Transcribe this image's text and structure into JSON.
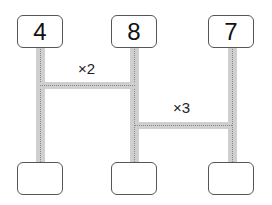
{
  "diagram": {
    "top_boxes": [
      {
        "value": "4"
      },
      {
        "value": "8"
      },
      {
        "value": "7"
      }
    ],
    "bottom_boxes": [
      {
        "value": ""
      },
      {
        "value": ""
      },
      {
        "value": ""
      }
    ],
    "connectors": [
      {
        "from": "left",
        "to": "middle",
        "label": "×2"
      },
      {
        "from": "middle",
        "to": "right",
        "label": "×3"
      }
    ]
  }
}
